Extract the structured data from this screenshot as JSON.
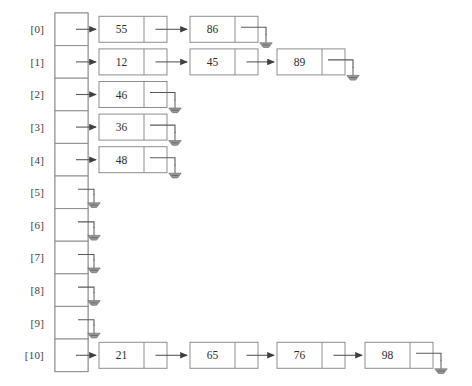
{
  "figure": {
    "array_label_format": "[i]",
    "null_symbol_name": "ground-null-symbol",
    "colors": {
      "background": "#ffffff",
      "box_stroke": "#8e8e8e",
      "link_stroke": "#5b5b5b",
      "text": "#2d2d2d",
      "label_text": "#3b3b3b",
      "ground_fill": "#9a9a9a"
    },
    "buckets": [
      {
        "label": "[0]",
        "index": 0,
        "values": [
          "55",
          "86"
        ]
      },
      {
        "label": "[1]",
        "index": 1,
        "values": [
          "12",
          "45",
          "89"
        ]
      },
      {
        "label": "[2]",
        "index": 2,
        "values": [
          "46"
        ]
      },
      {
        "label": "[3]",
        "index": 3,
        "values": [
          "36"
        ]
      },
      {
        "label": "[4]",
        "index": 4,
        "values": [
          "48"
        ]
      },
      {
        "label": "[5]",
        "index": 5,
        "values": []
      },
      {
        "label": "[6]",
        "index": 6,
        "values": []
      },
      {
        "label": "[7]",
        "index": 7,
        "values": []
      },
      {
        "label": "[8]",
        "index": 8,
        "values": []
      },
      {
        "label": "[9]",
        "index": 9,
        "values": []
      },
      {
        "label": "[10]",
        "index": 10,
        "values": [
          "21",
          "65",
          "76",
          "98"
        ]
      }
    ]
  },
  "geometry": {
    "array_x": 55,
    "array_width": 33,
    "array_top": 13,
    "row_height": 32.6,
    "rows": 11,
    "label_x": 44,
    "node_width": 68,
    "node_height": 26,
    "node_data_width": 45,
    "node_slots_x": [
      99,
      190,
      277,
      365
    ],
    "chain_gap": 23
  }
}
